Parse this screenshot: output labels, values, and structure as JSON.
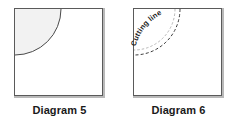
{
  "page": {
    "background_color": "#ffffff",
    "width": 238,
    "height": 126
  },
  "figures": [
    {
      "id": "diagram-5",
      "caption": "Diagram 5",
      "shape": "square",
      "square": {
        "stroke_color": "#5a5a5a",
        "fill_color": "#ffffff",
        "shadow_color": "#b9b9b9"
      },
      "region": {
        "type": "quarter-circle",
        "corner": "top-left",
        "fill_color": "#f2f2f2",
        "stroke_color": "#4a4a4a",
        "stroke_style": "solid",
        "radius_fraction": 0.52
      },
      "label": ""
    },
    {
      "id": "diagram-6",
      "caption": "Diagram 6",
      "shape": "square",
      "square": {
        "stroke_color": "#5a5a5a",
        "fill_color": "#ffffff",
        "shadow_color": "#b9b9b9"
      },
      "region": {
        "type": "quarter-arc",
        "corner": "top-left",
        "fill_color": "none",
        "stroke_color": "#3a3a3a",
        "stroke_style": "dashed",
        "radius_fraction": 0.52
      },
      "label": "Cutting line"
    }
  ]
}
